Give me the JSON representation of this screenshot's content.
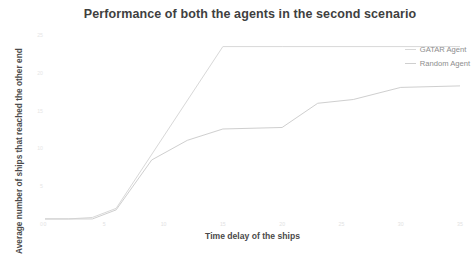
{
  "chart_data": {
    "type": "line",
    "title": "Performance of both the agents in the second scenario",
    "xlabel": "Time delay of the ships",
    "ylabel": "Average number of ships that reached the other end",
    "grid": false,
    "legend_position": "top-right",
    "xlim": [
      0,
      35
    ],
    "ylim": [
      0,
      25
    ],
    "xticks": [
      "0",
      "5",
      "10",
      "15",
      "20",
      "25",
      "30",
      "35"
    ],
    "yticks": [
      "0",
      "5",
      "10",
      "15",
      "20",
      "25"
    ],
    "series": [
      {
        "name": "GATAR Agent",
        "color": "#d8d8d8",
        "x": [
          0,
          2,
          4,
          6,
          15,
          20,
          35
        ],
        "values": [
          0.8,
          0.8,
          1.0,
          2.2,
          23.6,
          23.6,
          23.6
        ]
      },
      {
        "name": "Random Agent",
        "color": "#cfcfcf",
        "x": [
          0,
          2,
          4,
          6,
          9,
          12,
          15,
          20,
          23,
          26,
          30,
          35
        ],
        "values": [
          0.8,
          0.8,
          0.8,
          2.0,
          8.6,
          11.2,
          12.7,
          12.9,
          16.1,
          16.6,
          18.2,
          18.4
        ]
      }
    ]
  },
  "legend": {
    "items": [
      {
        "label": "GATAR Agent",
        "color": "#d8d8d8"
      },
      {
        "label": "Random Agent",
        "color": "#cfcfcf"
      }
    ]
  }
}
